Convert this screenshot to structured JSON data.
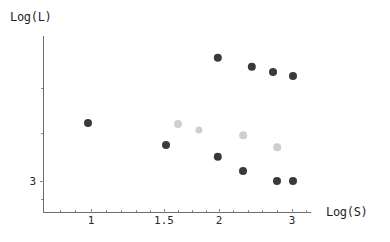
{
  "chart_data": {
    "type": "scatter",
    "title": "",
    "xlabel": "Log(S)",
    "ylabel": "Log(L)",
    "xlim": [
      0.6,
      3.25
    ],
    "ylim": [
      2.82,
      3.9
    ],
    "grid": false,
    "legend": "none",
    "xticks_major": [
      {
        "value": 1,
        "label": "1",
        "px": 91
      },
      {
        "value": 1.5,
        "label": "1.5",
        "px": 164
      },
      {
        "value": 2,
        "label": "2",
        "px": 219
      },
      {
        "value": 3,
        "label": "3",
        "px": 292
      }
    ],
    "xticks_minor_px": [
      60,
      75,
      106,
      121,
      136,
      150,
      178,
      192,
      206,
      233,
      248,
      262,
      277,
      306
    ],
    "yticks_major": [
      {
        "value": 3,
        "label": "3",
        "px": 181
      }
    ],
    "yticks_minor_px": [
      88,
      133,
      199
    ],
    "series": [
      {
        "name": "dark",
        "color": "#3a3a3a",
        "points": [
          {
            "x": 1.0,
            "y": 3.38,
            "px": 88,
            "py": 123,
            "r": 4.0
          },
          {
            "x": 1.48,
            "y": 3.24,
            "px": 166,
            "py": 145,
            "r": 4.0
          },
          {
            "x": 2.0,
            "y": 3.78,
            "px": 218,
            "py": 58,
            "r": 4.2
          },
          {
            "x": 2.0,
            "y": 3.16,
            "px": 218,
            "py": 157,
            "r": 4.2
          },
          {
            "x": 2.18,
            "y": 3.07,
            "px": 243,
            "py": 171,
            "r": 4.0
          },
          {
            "x": 2.24,
            "y": 3.7,
            "px": 252,
            "py": 67,
            "r": 4.2
          },
          {
            "x": 2.48,
            "y": 3.67,
            "px": 273,
            "py": 72,
            "r": 4.0
          },
          {
            "x": 2.88,
            "y": 3.0,
            "px": 277,
            "py": 181,
            "r": 4.0
          },
          {
            "x": 3.0,
            "y": 3.0,
            "px": 293,
            "py": 181,
            "r": 4.0
          },
          {
            "x": 3.0,
            "y": 3.64,
            "px": 293,
            "py": 76,
            "r": 4.0
          }
        ]
      },
      {
        "name": "light",
        "color": "#cfcfcf",
        "points": [
          {
            "x": 1.6,
            "y": 3.38,
            "px": 178,
            "py": 124,
            "r": 4.0
          },
          {
            "x": 1.82,
            "y": 3.35,
            "px": 199,
            "py": 130,
            "r": 3.6
          },
          {
            "x": 2.18,
            "y": 3.31,
            "px": 243,
            "py": 135,
            "r": 3.8
          },
          {
            "x": 2.86,
            "y": 3.22,
            "px": 277,
            "py": 147,
            "r": 3.8
          }
        ]
      }
    ]
  },
  "axes": {
    "x_title": "Log(S)",
    "y_title": "Log(L)"
  }
}
